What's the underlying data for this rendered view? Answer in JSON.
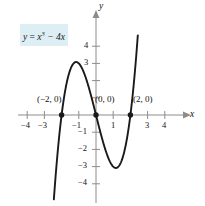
{
  "figure": {
    "kind": "cartesian-graph",
    "equation_label": {
      "plain": "y = x^3 - 4x",
      "lhs": "y",
      "eq": "=",
      "base": "x",
      "exponent": "3",
      "rest": "− 4x",
      "highlight_color": "#ddeef4"
    },
    "axes": {
      "x_name": "x",
      "y_name": "y",
      "curve_color": "#1a1a1a",
      "axis_color": "#8c8c8c",
      "x_ticks": [
        {
          "value": -4,
          "label": "−4"
        },
        {
          "value": -3,
          "label": "−3"
        },
        {
          "value": -2,
          "label": ""
        },
        {
          "value": -1,
          "label": "−1"
        },
        {
          "value": 1,
          "label": "1"
        },
        {
          "value": 2,
          "label": ""
        },
        {
          "value": 3,
          "label": "3"
        },
        {
          "value": 4,
          "label": "4"
        }
      ],
      "y_ticks": [
        {
          "value": 4,
          "label": "4"
        },
        {
          "value": 3,
          "label": "3"
        },
        {
          "value": 2,
          "label": ""
        },
        {
          "value": 1,
          "label": ""
        },
        {
          "value": -1,
          "label": "−1"
        },
        {
          "value": -2,
          "label": "−2"
        },
        {
          "value": -3,
          "label": "−3"
        },
        {
          "value": -4,
          "label": "−4"
        }
      ],
      "xlim": [
        -4.6,
        4.8
      ],
      "ylim": [
        -4.7,
        5.2
      ]
    },
    "points": [
      {
        "name": "x-intercept-left",
        "label": "(−2, 0)",
        "x": -2,
        "y": 0
      },
      {
        "name": "origin",
        "label": "(0, 0)",
        "x": 0,
        "y": 0
      },
      {
        "name": "x-intercept-right",
        "label": "(2, 0)",
        "x": 2,
        "y": 0
      }
    ]
  },
  "chart_data": {
    "type": "line",
    "title": "",
    "subtitle": "",
    "xlabel": "x",
    "ylabel": "y",
    "grid": false,
    "legend": "none",
    "annotations": [
      "y = x³ − 4x",
      "(−2, 0)",
      "(0, 0)",
      "(2, 0)"
    ],
    "xlim": [
      -4.6,
      4.8
    ],
    "ylim": [
      -4.7,
      5.2
    ],
    "xticks": [
      -4,
      -3,
      -2,
      -1,
      0,
      1,
      2,
      3,
      4
    ],
    "yticks": [
      -4,
      -3,
      -2,
      -1,
      1,
      2,
      3,
      4
    ],
    "series": [
      {
        "name": "y = x^3 - 4x",
        "function": "x^3 - 4x",
        "x": [
          -2.35,
          -2.2,
          -2.0,
          -1.8,
          -1.6,
          -1.4,
          -1.2,
          -1.1547,
          -1.0,
          -0.8,
          -0.6,
          -0.4,
          -0.2,
          0.0,
          0.2,
          0.4,
          0.6,
          0.8,
          1.0,
          1.1547,
          1.2,
          1.4,
          1.6,
          1.8,
          2.0,
          2.2,
          2.35
        ],
        "y": [
          -3.58,
          -2.25,
          0.0,
          1.37,
          2.3,
          2.86,
          3.07,
          3.079,
          3.0,
          2.69,
          2.18,
          1.54,
          0.79,
          0.0,
          -0.79,
          -1.54,
          -2.18,
          -2.69,
          -3.0,
          -3.079,
          -3.07,
          -2.86,
          -2.3,
          -1.37,
          0.0,
          2.25,
          3.58
        ]
      }
    ],
    "roots": [
      -2,
      0,
      2
    ],
    "local_max": {
      "x": -1.1547,
      "y": 3.079
    },
    "local_min": {
      "x": 1.1547,
      "y": -3.079
    }
  }
}
